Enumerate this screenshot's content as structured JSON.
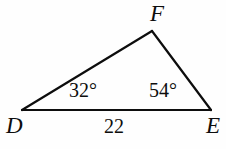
{
  "figure": {
    "type": "triangle",
    "name": "triangle-DFE",
    "background_color": "#fefefe",
    "stroke_color": "#0d0d0d",
    "text_color": "#0d0d0d",
    "stroke_width": 2.2,
    "vertices": [
      {
        "id": "D",
        "label": "D",
        "x": 22,
        "y": 110
      },
      {
        "id": "F",
        "label": "F",
        "x": 152,
        "y": 31
      },
      {
        "id": "E",
        "label": "E",
        "x": 211,
        "y": 110
      }
    ],
    "edges": [
      {
        "id": "DF",
        "from": "D",
        "to": "F"
      },
      {
        "id": "FE",
        "from": "F",
        "to": "E"
      },
      {
        "id": "DE",
        "from": "D",
        "to": "E"
      }
    ],
    "angles": [
      {
        "at": "D",
        "value": "32°"
      },
      {
        "at": "E",
        "value": "54°"
      }
    ],
    "side_lengths": [
      {
        "edge": "DE",
        "value": "22"
      }
    ]
  },
  "chart_data": {
    "type": "diagram",
    "title": "",
    "shape": "triangle",
    "points": {
      "D": [
        22,
        110
      ],
      "F": [
        152,
        31
      ],
      "E": [
        211,
        110
      ]
    },
    "labels": [
      "D",
      "F",
      "E"
    ],
    "angle_labels": [
      "32°",
      "54°"
    ],
    "side_labels": [
      "22"
    ]
  }
}
